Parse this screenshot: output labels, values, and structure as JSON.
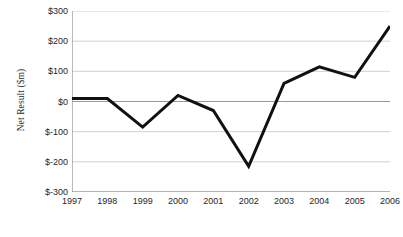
{
  "chart_data": {
    "type": "line",
    "title": "",
    "xlabel": "",
    "ylabel": "Net Result ($m)",
    "categories": [
      "1997",
      "1998",
      "1999",
      "2000",
      "2001",
      "2002",
      "2003",
      "2004",
      "2005",
      "2006"
    ],
    "values": [
      10,
      10,
      -85,
      20,
      -30,
      -215,
      60,
      115,
      80,
      250
    ],
    "series": [
      {
        "name": "Net Result",
        "values": [
          10,
          10,
          -85,
          20,
          -30,
          -215,
          60,
          115,
          80,
          250
        ]
      }
    ],
    "ylim": [
      -300,
      300
    ],
    "ytick_values": [
      300,
      200,
      100,
      0,
      -100,
      -200,
      -300
    ],
    "ytick_labels": [
      "$300",
      "$200",
      "$100",
      "$0",
      "$-100",
      "$-200",
      "$-300"
    ],
    "xtick_labels": [
      "1997",
      "1998",
      "1999",
      "2000",
      "2001",
      "2002",
      "2003",
      "2004",
      "2005",
      "2006"
    ],
    "grid": true,
    "grid_axis": "y",
    "legend": false,
    "legend_position": "none",
    "line_color": "#111111",
    "grid_color": "#bdbdbd",
    "axis_color": "#808080",
    "zero_line_color": "#999999",
    "background_color": "#ffffff",
    "line_width": 3
  },
  "axes": {
    "y_title": "Net Result ($m)"
  }
}
